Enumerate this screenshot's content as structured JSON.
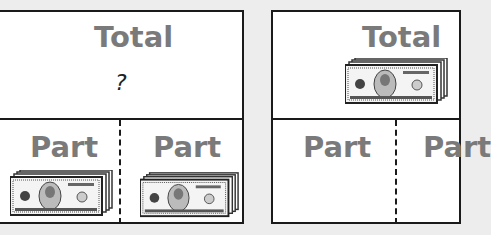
{
  "diagrams": [
    {
      "total": {
        "label": "Total",
        "value": "?"
      },
      "parts": [
        {
          "label": "Part",
          "icon": "money-stack-icon"
        },
        {
          "label": "Part",
          "icon": "money-stack-icon"
        }
      ]
    },
    {
      "total": {
        "label": "Total",
        "icon": "money-stack-icon"
      },
      "parts": [
        {
          "label": "Part"
        },
        {
          "label": "Part"
        }
      ]
    }
  ],
  "colors": {
    "label": "#7a7a7a",
    "border": "#1a1a1a",
    "background": "#ededed"
  }
}
